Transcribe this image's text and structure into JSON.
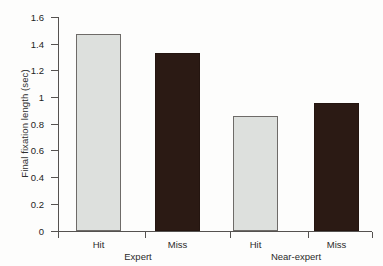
{
  "chart_data": {
    "type": "bar",
    "title": "",
    "xlabel": "",
    "ylabel": "Final fixation length (sec)",
    "ylim": [
      0,
      1.6
    ],
    "grid": false,
    "legend_position": "none",
    "categories": [
      "Hit",
      "Miss",
      "Hit",
      "Miss"
    ],
    "groups": [
      {
        "name": "Expert",
        "categories": [
          "Hit",
          "Miss"
        ],
        "values": [
          1.47,
          1.33
        ]
      },
      {
        "name": "Near-expert",
        "categories": [
          "Hit",
          "Miss"
        ],
        "values": [
          0.86,
          0.96
        ]
      }
    ],
    "values": [
      1.47,
      1.33,
      0.86,
      0.96
    ],
    "bar_styles": [
      "light",
      "dark",
      "light",
      "dark"
    ],
    "ytick_labels": [
      "1.6",
      "1.4",
      "1.2",
      "1",
      "0.8",
      "0.6",
      "0.4",
      "0.2",
      "0"
    ],
    "ytick_values": [
      1.6,
      1.4,
      1.2,
      1.0,
      0.8,
      0.6,
      0.4,
      0.2,
      0
    ],
    "colors": {
      "light_bar": "#dde0dd",
      "dark_bar": "#2b1a14",
      "bar_outline": "#6e6b68",
      "axis": "#555250",
      "text": "#232323",
      "background": "#fdfdfc"
    }
  },
  "bars": [
    {
      "label": "Hit",
      "value": 1.47,
      "style": "light",
      "left": 76,
      "width": 45
    },
    {
      "label": "Miss",
      "value": 1.33,
      "style": "dark",
      "left": 155,
      "width": 45
    },
    {
      "label": "Hit",
      "value": 0.86,
      "style": "light",
      "left": 233,
      "width": 45
    },
    {
      "label": "Miss",
      "value": 0.96,
      "style": "dark",
      "left": 314,
      "width": 45
    }
  ],
  "group_labels": [
    {
      "text": "Expert",
      "center": 138
    },
    {
      "text": "Near-expert",
      "center": 296
    }
  ],
  "axis": {
    "ylabel": "Final fixation length (sec)",
    "ticks": [
      {
        "label": "1.6",
        "y": 17
      },
      {
        "label": "1.4",
        "y": 44
      },
      {
        "label": "1.2",
        "y": 70
      },
      {
        "label": "1",
        "y": 97
      },
      {
        "label": "0.8",
        "y": 124
      },
      {
        "label": "0.6",
        "y": 150
      },
      {
        "label": "0.4",
        "y": 177
      },
      {
        "label": "0.2",
        "y": 204
      },
      {
        "label": "0",
        "y": 231
      }
    ],
    "xticks": [
      58,
      145,
      230,
      308,
      372
    ]
  }
}
